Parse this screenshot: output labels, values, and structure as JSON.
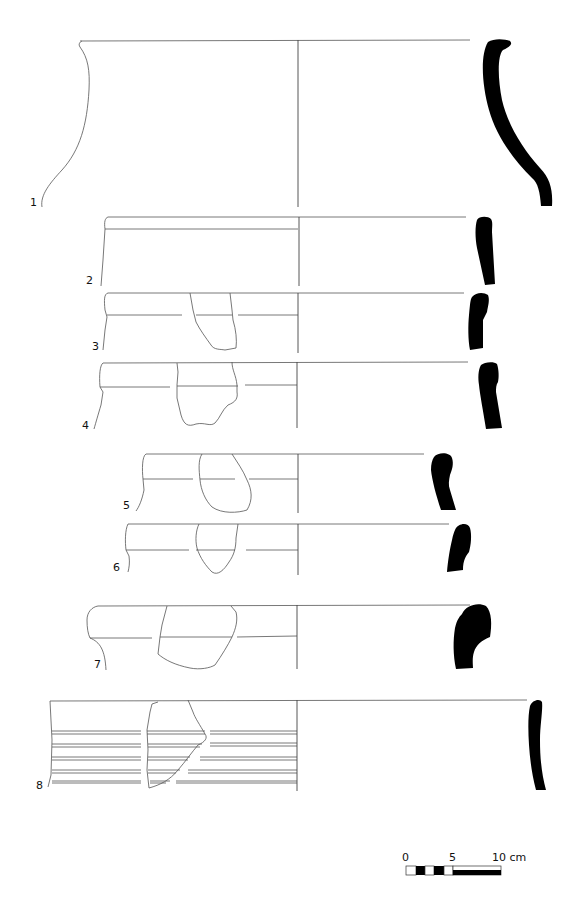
{
  "figure": {
    "type": "pottery rim profiles",
    "items": [
      {
        "number": "1"
      },
      {
        "number": "2"
      },
      {
        "number": "3"
      },
      {
        "number": "4"
      },
      {
        "number": "5"
      },
      {
        "number": "6"
      },
      {
        "number": "7"
      },
      {
        "number": "8"
      }
    ],
    "scale_bar": {
      "labels": [
        "0",
        "5",
        "10 cm"
      ],
      "range_cm": [
        0,
        10
      ]
    },
    "colors": {
      "section_fill": "#000000",
      "line": "#555555",
      "background": "#ffffff"
    }
  }
}
